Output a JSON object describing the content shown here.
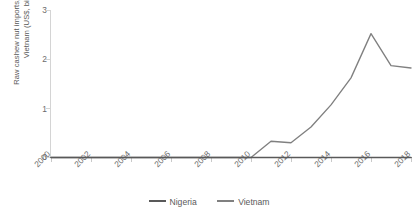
{
  "chart_data": {
    "type": "line",
    "title": "",
    "xlabel": "",
    "ylabel": "Raw cashew nut imports, Nigeria and Vietnam (US$, billion)",
    "xlim": [
      2000,
      2018
    ],
    "ylim": [
      0,
      3
    ],
    "grid": false,
    "legend_position": "bottom",
    "x": [
      2000,
      2001,
      2002,
      2003,
      2004,
      2005,
      2006,
      2007,
      2008,
      2009,
      2010,
      2011,
      2012,
      2013,
      2014,
      2015,
      2016,
      2017,
      2018
    ],
    "xticks": [
      2000,
      2002,
      2004,
      2006,
      2008,
      2010,
      2012,
      2014,
      2016,
      2018
    ],
    "xtick_labels": [
      "2000",
      "2002",
      "2004",
      "2006",
      "2008",
      "2010",
      "2012",
      "2014",
      "2016",
      "2018"
    ],
    "yticks": [
      0,
      1,
      2,
      3
    ],
    "ytick_labels": [
      "0",
      "1",
      "2",
      "3"
    ],
    "series": [
      {
        "name": "Nigeria",
        "color": "#595959",
        "values": [
          0,
          0,
          0,
          0,
          0,
          0,
          0,
          0,
          0,
          0,
          0,
          0,
          0,
          0,
          0,
          0,
          0,
          0,
          0
        ]
      },
      {
        "name": "Vietnam",
        "color": "#808080",
        "values": [
          0,
          0,
          0,
          0,
          0,
          0,
          0,
          0,
          0,
          0,
          0,
          0.33,
          0.3,
          0.62,
          1.07,
          1.62,
          2.52,
          1.87,
          1.82
        ]
      }
    ]
  },
  "axes": {
    "y_label_text": "Raw cashew nut imports, Nigeria and Vietnam (US$, billion)",
    "y_tick_0": "0",
    "y_tick_1": "1",
    "y_tick_2": "2",
    "y_tick_3": "3",
    "x_tick_2000": "2000",
    "x_tick_2002": "2002",
    "x_tick_2004": "2004",
    "x_tick_2006": "2006",
    "x_tick_2008": "2008",
    "x_tick_2010": "2010",
    "x_tick_2012": "2012",
    "x_tick_2014": "2014",
    "x_tick_2016": "2016",
    "x_tick_2018": "2018"
  },
  "legend": {
    "items": [
      {
        "label": "Nigeria",
        "color": "#595959"
      },
      {
        "label": "Vietnam",
        "color": "#808080"
      }
    ]
  },
  "colors": {
    "nigeria": "#595959",
    "vietnam": "#808080",
    "axis": "#a6a6a6",
    "gridline": "#d4d4d4",
    "text": "#6b6b6b",
    "background": "#ffffff"
  }
}
